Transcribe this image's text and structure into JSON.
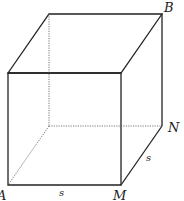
{
  "diagram": {
    "vertices": {
      "front_top_left": [
        8,
        73
      ],
      "front_top_right": [
        121,
        73
      ],
      "back_top_left": [
        49,
        14
      ],
      "back_top_right": [
        162,
        14
      ],
      "front_bottom_left": [
        8,
        185
      ],
      "front_bottom_right": [
        121,
        185
      ],
      "back_bottom_right": [
        162,
        126
      ],
      "back_bottom_left": [
        49,
        126
      ]
    },
    "labels": {
      "B": "B",
      "N": "N",
      "M": "M",
      "A": "A",
      "side_bottom": "s",
      "side_right": "s"
    },
    "colors": {
      "edge": "#222222",
      "hidden_edge": "#555555"
    }
  }
}
